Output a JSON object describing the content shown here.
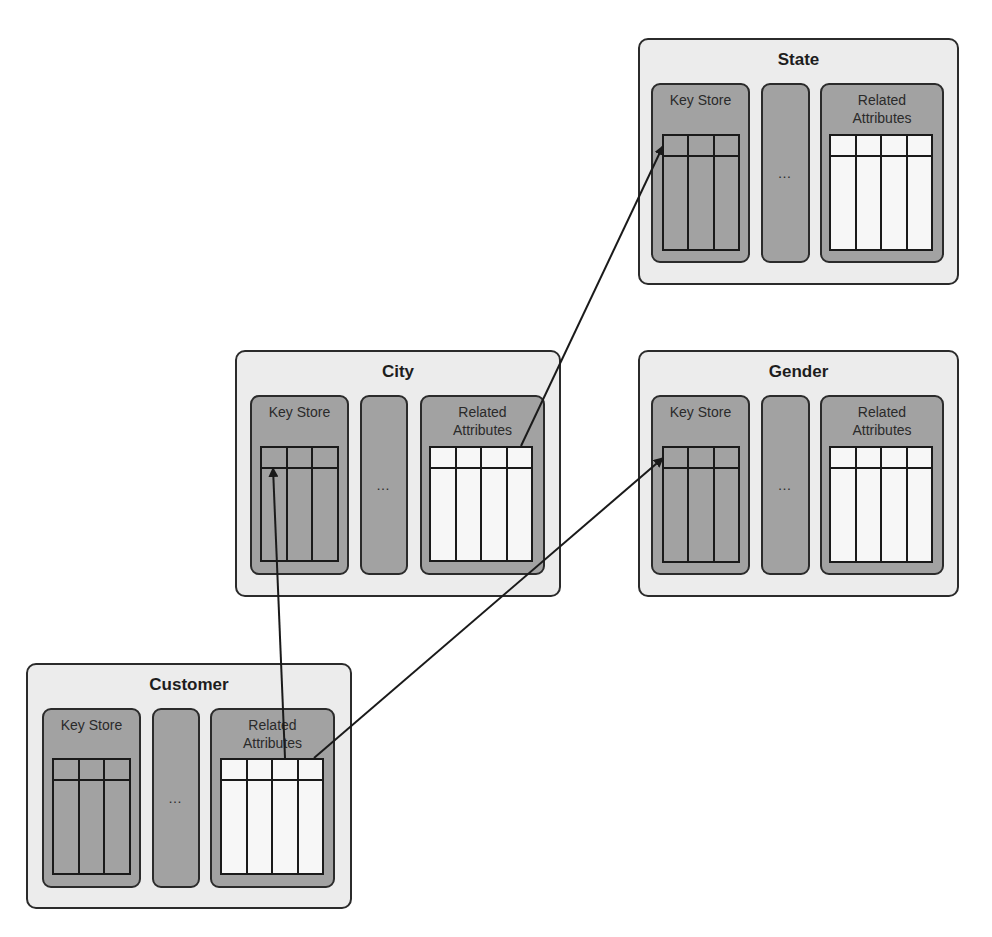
{
  "diagram": {
    "entities": [
      {
        "id": "state",
        "title": "State",
        "key_store_label": "Key Store",
        "ellipsis": "…",
        "related_label": "Related Attributes",
        "key_columns": 3,
        "attr_columns": 4
      },
      {
        "id": "gender",
        "title": "Gender",
        "key_store_label": "Key Store",
        "ellipsis": "…",
        "related_label": "Related Attributes",
        "key_columns": 3,
        "attr_columns": 4
      },
      {
        "id": "city",
        "title": "City",
        "key_store_label": "Key Store",
        "ellipsis": "…",
        "related_label": "Related Attributes",
        "key_columns": 3,
        "attr_columns": 4
      },
      {
        "id": "customer",
        "title": "Customer",
        "key_store_label": "Key Store",
        "ellipsis": "…",
        "related_label": "Related Attributes",
        "key_columns": 3,
        "attr_columns": 4
      }
    ],
    "arrows": [
      {
        "from": "customer.related_attributes",
        "to": "city.key_store"
      },
      {
        "from": "customer.related_attributes",
        "to": "gender.key_store"
      },
      {
        "from": "city.related_attributes",
        "to": "state.key_store"
      }
    ],
    "colors": {
      "outer_fill": "#ececec",
      "panel_fill": "#a2a2a2",
      "attr_table_fill": "#f7f7f7",
      "stroke": "#1a1a1a"
    }
  }
}
